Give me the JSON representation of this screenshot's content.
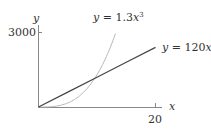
{
  "chart_data": {
    "type": "line",
    "title": "",
    "xlabel": "x",
    "ylabel": "y",
    "xlim": [
      0,
      20
    ],
    "ylim": [
      0,
      3000
    ],
    "x_ticks": [
      "20"
    ],
    "y_ticks": [
      "3000"
    ],
    "grid": false,
    "legend": "inline labels",
    "series": [
      {
        "name": "y = 1.3x^3",
        "label_text": "y = 1.3x³",
        "color": "#b8b8b8",
        "formula": "1.3*x^3",
        "x": [
          0,
          2,
          4,
          6,
          8,
          10,
          12,
          13.2
        ],
        "values": [
          0,
          10.4,
          83.2,
          280.8,
          665.6,
          1300,
          2246.4,
          2990
        ]
      },
      {
        "name": "y = 120x",
        "label_text": "y = 120x",
        "color": "#444444",
        "formula": "120*x",
        "x": [
          0,
          5,
          10,
          15,
          20
        ],
        "values": [
          0,
          600,
          1200,
          1800,
          2400
        ]
      }
    ],
    "annotations": [
      "y = 1.3x³",
      "y = 120x"
    ]
  },
  "labels": {
    "x_axis": "x",
    "y_axis": "y",
    "x_tick": "20",
    "y_tick": "3000",
    "cubic_prefix": "y = 1.3",
    "cubic_var": "x",
    "cubic_exp": "3",
    "linear_prefix": "y = 120",
    "linear_var": "x"
  }
}
